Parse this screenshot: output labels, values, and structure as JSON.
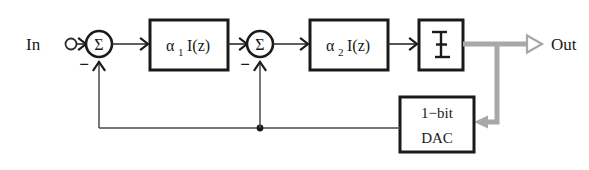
{
  "diagram": {
    "input": {
      "label": "In",
      "terminal_icon": "open-circle-terminal"
    },
    "output": {
      "label": "Out",
      "terminal_icon": "triangle-terminal"
    },
    "summers": [
      {
        "symbol": "Σ",
        "sign": "−",
        "name": "first-summer"
      },
      {
        "symbol": "Σ",
        "sign": "−",
        "name": "second-summer"
      }
    ],
    "blocks": [
      {
        "name": "first-integrator",
        "gain": "α",
        "subscript": "1",
        "transfer": "I(z)"
      },
      {
        "name": "second-integrator",
        "gain": "α",
        "subscript": "2",
        "transfer": "I(z)"
      }
    ],
    "quantizer": {
      "name": "quantizer",
      "symbol_icon": "step-function-icon"
    },
    "dac": {
      "line1": "1−bit",
      "line2": "DAC"
    },
    "colors": {
      "signal_path": "#2b2b2b",
      "feedback_path": "#4a4a4a",
      "output_path": "#a8a8a8",
      "block_outline": "#1a1a1a",
      "background": "#ffffff"
    }
  }
}
